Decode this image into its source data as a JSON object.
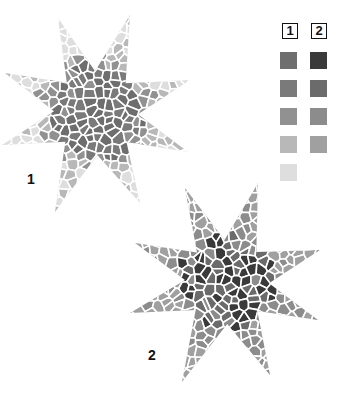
{
  "legend": {
    "columns": [
      {
        "label": "1",
        "swatches": [
          "#6e6e6e",
          "#7a7a7a",
          "#919191",
          "#b8b8b8",
          "#dedede"
        ]
      },
      {
        "label": "2",
        "swatches": [
          "#3a3a3a",
          "#6b6b6b",
          "#8c8c8c",
          "#a0a0a0"
        ]
      }
    ]
  },
  "stars": [
    {
      "label": "1",
      "center": [
        96,
        113
      ],
      "tips": [
        [
          58,
          18
        ],
        [
          130,
          15
        ],
        [
          190,
          80
        ],
        [
          188,
          152
        ],
        [
          140,
          203
        ],
        [
          55,
          212
        ],
        [
          2,
          145
        ],
        [
          5,
          73
        ]
      ],
      "palette": [
        "#6e6e6e",
        "#7a7a7a",
        "#919191",
        "#b8b8b8",
        "#dedede"
      ],
      "seed": 11
    },
    {
      "label": "2",
      "center": [
        227,
        282
      ],
      "tips": [
        [
          185,
          188
        ],
        [
          258,
          183
        ],
        [
          320,
          250
        ],
        [
          318,
          320
        ],
        [
          270,
          375
        ],
        [
          182,
          382
        ],
        [
          130,
          313
        ],
        [
          135,
          243
        ]
      ],
      "palette": [
        "#3a3a3a",
        "#6b6b6b",
        "#8c8c8c",
        "#a0a0a0"
      ],
      "seed": 29
    }
  ]
}
